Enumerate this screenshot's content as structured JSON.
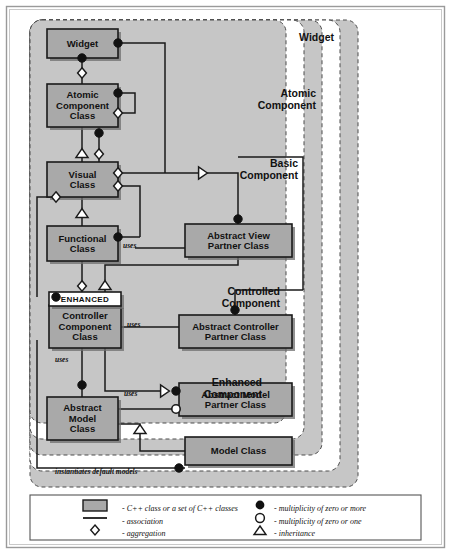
{
  "diagram": {
    "type": "uml-class-diagram",
    "colors": {
      "page_background": "#ffffff",
      "outer_border": "#8a8a8a",
      "region_fill_shaded": "#c6c6c6",
      "region_fill_plain": "#ffffff",
      "region_stroke": "#4d4d4d",
      "class_fill": "#a9a9a9",
      "class_stroke": "#1a1a1a",
      "class_shadow": "#6e6e6e",
      "stereotype_fill": "#ffffff",
      "line": "#1a1a1a",
      "marker_filled": "#111111",
      "marker_hollow": "#ffffff"
    },
    "regions": [
      {
        "id": "widget",
        "label": "Widget",
        "x": 30,
        "y": 20,
        "w": 328,
        "h": 467,
        "shaded": true,
        "label_x": 330,
        "label_y": 36
      },
      {
        "id": "atomic",
        "label": "Atomic\nComponent",
        "x": 30,
        "y": 20,
        "w": 310,
        "h": 451,
        "shaded": false,
        "label_x": 312,
        "label_y": 93
      },
      {
        "id": "basic",
        "label": "Basic\nComponent",
        "x": 30,
        "y": 20,
        "w": 292,
        "h": 435,
        "shaded": true,
        "label_x": 294,
        "label_y": 163
      },
      {
        "id": "controlled",
        "label": "Controlled\nComponent",
        "x": 30,
        "y": 20,
        "w": 274,
        "h": 419,
        "shaded": false,
        "label_x": 276,
        "label_y": 291
      },
      {
        "id": "enhanced",
        "label": "Enhanced\nComponent",
        "x": 30,
        "y": 20,
        "w": 256,
        "h": 403,
        "shaded": true,
        "label_x": 258,
        "label_y": 382
      }
    ],
    "region_labels": [
      {
        "id": "widget",
        "lines": [
          "Widget"
        ],
        "x": 334,
        "y": 41
      },
      {
        "id": "atomic",
        "lines": [
          "Atomic",
          "Component"
        ],
        "x": 316,
        "y": 97
      },
      {
        "id": "basic",
        "lines": [
          "Basic",
          "Component"
        ],
        "x": 298,
        "y": 167
      },
      {
        "id": "controlled",
        "lines": [
          "Controlled",
          "Component"
        ],
        "x": 280,
        "y": 295
      },
      {
        "id": "enhanced",
        "lines": [
          "Enhanced",
          "Component"
        ],
        "x": 262,
        "y": 386
      }
    ],
    "classes": [
      {
        "id": "widget-class",
        "lines": [
          "Widget"
        ],
        "x": 47,
        "y": 29,
        "w": 71,
        "h": 29
      },
      {
        "id": "atomic-component-class",
        "lines": [
          "Atomic",
          "Component",
          "Class"
        ],
        "x": 47,
        "y": 84,
        "w": 71,
        "h": 43
      },
      {
        "id": "visual-class",
        "lines": [
          "Visual",
          "Class"
        ],
        "x": 47,
        "y": 162,
        "w": 71,
        "h": 35
      },
      {
        "id": "functional-class",
        "lines": [
          "Functional",
          "Class"
        ],
        "x": 47,
        "y": 226,
        "w": 71,
        "h": 35
      },
      {
        "id": "abstract-view-partner",
        "lines": [
          "Abstract View",
          "Partner Class"
        ],
        "x": 185,
        "y": 224,
        "w": 107,
        "h": 33
      },
      {
        "id": "controller-component",
        "lines": [
          "Controller",
          "Component",
          "Class"
        ],
        "x": 49,
        "y": 305,
        "w": 72,
        "h": 43
      },
      {
        "id": "abstract-controller",
        "lines": [
          "Abstract Controller",
          "Partner Class"
        ],
        "x": 179,
        "y": 315,
        "w": 113,
        "h": 33
      },
      {
        "id": "abstract-model-partner",
        "lines": [
          "Abstract Model",
          "Partner Class"
        ],
        "x": 179,
        "y": 383,
        "w": 113,
        "h": 33
      },
      {
        "id": "abstract-model-class",
        "lines": [
          "Abstract",
          "Model",
          "Class"
        ],
        "x": 47,
        "y": 397,
        "w": 71,
        "h": 43
      },
      {
        "id": "model-class",
        "lines": [
          "Model Class"
        ],
        "x": 185,
        "y": 437,
        "w": 107,
        "h": 28
      }
    ],
    "stereotype": {
      "id": "enhanced-stereotype",
      "label": "ENHANCED",
      "x": 49,
      "y": 292,
      "w": 72,
      "h": 14
    },
    "edge_labels": [
      {
        "id": "uses-functional",
        "text": "uses",
        "x": 123,
        "y": 248
      },
      {
        "id": "uses-controller",
        "text": "uses",
        "x": 127,
        "y": 327
      },
      {
        "id": "uses-model-down",
        "text": "uses",
        "x": 55,
        "y": 362
      },
      {
        "id": "uses-model",
        "text": "uses",
        "x": 124,
        "y": 396
      },
      {
        "id": "instantiates",
        "text": "instantiates default models",
        "x": 55,
        "y": 474
      }
    ],
    "connectors": [
      {
        "id": "widget-to-right-bus",
        "points": "118,43 165,43 165,173"
      },
      {
        "id": "widget-to-atomic",
        "points": "82,58 82,84"
      },
      {
        "id": "atomic-self-loop",
        "points": "118,93 135,93 135,113 118,113"
      },
      {
        "id": "atomic-to-visual-inherit",
        "points": "82,127 82,162"
      },
      {
        "id": "atomic-to-visual-aggr",
        "points": "99,127 99,162"
      },
      {
        "id": "visual-to-inherit-bus",
        "points": "118,173 205,173"
      },
      {
        "id": "inherit-bus-to-view",
        "points": "205,173 238,173 238,224"
      },
      {
        "id": "view-bus-right",
        "points": "238,157 303,157 303,290"
      },
      {
        "id": "visual-right-to-func",
        "points": "118,186 140,186 140,237"
      },
      {
        "id": "func-dot-to-visual",
        "points": "118,237 140,237"
      },
      {
        "id": "visual-left-aggr-down",
        "points": "56,197 37,197 37,297"
      },
      {
        "id": "visual-to-functional",
        "points": "82,197 82,226"
      },
      {
        "id": "func-to-controller",
        "points": "82,261 82,292"
      },
      {
        "id": "func-uses-view",
        "points": "135,248 185,248"
      },
      {
        "id": "view-bottom-down",
        "points": "238,257 238,265 105,265 105,292"
      },
      {
        "id": "controlled-bus-to-ctrl",
        "points": "303,290 235,290 235,315"
      },
      {
        "id": "ctrl-uses-partner",
        "points": "121,327 179,327"
      },
      {
        "id": "ctrl-to-model-partner",
        "points": "105,348 105,391 167,391"
      },
      {
        "id": "ctrl-to-abstract-model",
        "points": "82,348 82,397"
      },
      {
        "id": "ctrl-left-instantiate",
        "points": "37,340 37,468 185,468"
      },
      {
        "id": "model-uses-partner",
        "points": "118,409 179,409"
      },
      {
        "id": "model-to-model-class",
        "points": "118,424 140,424 140,451 185,451"
      }
    ],
    "markers": [
      {
        "id": "m-widget-right",
        "kind": "filled-circle",
        "x": 118,
        "y": 43
      },
      {
        "id": "m-widget-bottom",
        "kind": "filled-circle",
        "x": 82,
        "y": 58
      },
      {
        "id": "m-atomic-top-aggr",
        "kind": "diamond",
        "x": 82,
        "y": 73
      },
      {
        "id": "m-atomic-right-dot",
        "kind": "filled-circle",
        "x": 118,
        "y": 93
      },
      {
        "id": "m-atomic-right-aggr",
        "kind": "diamond",
        "x": 118,
        "y": 113
      },
      {
        "id": "m-atomic-bot-dot",
        "kind": "filled-circle",
        "x": 99,
        "y": 133
      },
      {
        "id": "m-visual-inherit",
        "kind": "triangle-up",
        "x": 82,
        "y": 154
      },
      {
        "id": "m-visual-top-aggr",
        "kind": "diamond",
        "x": 99,
        "y": 154
      },
      {
        "id": "m-visual-right-aggr1",
        "kind": "diamond",
        "x": 118,
        "y": 173
      },
      {
        "id": "m-visual-right-aggr2",
        "kind": "diamond",
        "x": 118,
        "y": 186
      },
      {
        "id": "m-visual-left-aggr",
        "kind": "diamond",
        "x": 56,
        "y": 197
      },
      {
        "id": "m-view-inherit",
        "kind": "triangle-right",
        "x": 202,
        "y": 173
      },
      {
        "id": "m-view-top-dot",
        "kind": "filled-circle",
        "x": 238,
        "y": 219
      },
      {
        "id": "m-func-inherit",
        "kind": "triangle-up",
        "x": 82,
        "y": 214
      },
      {
        "id": "m-func-right-dot",
        "kind": "filled-circle",
        "x": 118,
        "y": 237
      },
      {
        "id": "m-ctrl-left-dot",
        "kind": "filled-circle",
        "x": 56,
        "y": 297
      },
      {
        "id": "m-ctrl-top-aggr",
        "kind": "diamond",
        "x": 82,
        "y": 286
      },
      {
        "id": "m-ctrl-inherit",
        "kind": "triangle-up",
        "x": 105,
        "y": 286
      },
      {
        "id": "m-ctrl-partner-dot",
        "kind": "filled-circle",
        "x": 235,
        "y": 310
      },
      {
        "id": "m-amp-inherit",
        "kind": "triangle-right",
        "x": 164,
        "y": 391
      },
      {
        "id": "m-amp-left-dot",
        "kind": "filled-circle",
        "x": 176,
        "y": 391
      },
      {
        "id": "m-amc-top-dot",
        "kind": "filled-circle",
        "x": 82,
        "y": 385
      },
      {
        "id": "m-amp-uses-hollow",
        "kind": "hollow-circle",
        "x": 176,
        "y": 409
      },
      {
        "id": "m-model-inherit",
        "kind": "triangle-up",
        "x": 140,
        "y": 430
      },
      {
        "id": "m-model-left-dot",
        "kind": "filled-circle",
        "x": 179,
        "y": 468
      }
    ],
    "legend": {
      "box": {
        "x": 30,
        "y": 495,
        "w": 391,
        "h": 45
      },
      "items": [
        {
          "id": "legend-class",
          "symbol": "box",
          "text": "- C++ class or a set of C++ classes",
          "sym_x": 95,
          "sym_y": 505,
          "text_x": 122,
          "text_y": 508
        },
        {
          "id": "legend-association",
          "symbol": "line",
          "text": "- association",
          "sym_x": 95,
          "sym_y": 518,
          "text_x": 122,
          "text_y": 521
        },
        {
          "id": "legend-aggregation",
          "symbol": "diamond",
          "text": "- aggregation",
          "sym_x": 95,
          "sym_y": 530,
          "text_x": 122,
          "text_y": 533
        },
        {
          "id": "legend-zero-or-more",
          "symbol": "filled-circle",
          "text": "- multiplicity of zero or more",
          "sym_x": 260,
          "sym_y": 505,
          "text_x": 274,
          "text_y": 508
        },
        {
          "id": "legend-zero-or-one",
          "symbol": "hollow-circle",
          "text": "- multiplicity of zero or one",
          "sym_x": 260,
          "sym_y": 518,
          "text_x": 274,
          "text_y": 521
        },
        {
          "id": "legend-inheritance",
          "symbol": "triangle-up",
          "text": "- inheritance",
          "sym_x": 260,
          "sym_y": 531,
          "text_x": 274,
          "text_y": 533
        }
      ]
    }
  }
}
